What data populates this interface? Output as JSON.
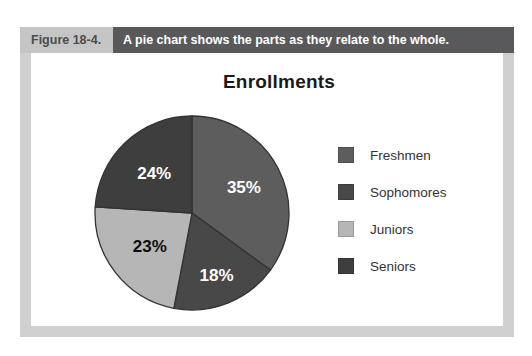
{
  "figure": {
    "label": "Figure 18-4.",
    "caption": "A pie chart shows the parts as they relate to the whole."
  },
  "chart_data": {
    "type": "pie",
    "title": "Enrollments",
    "categories": [
      "Freshmen",
      "Sophomores",
      "Juniors",
      "Seniors"
    ],
    "values": [
      35,
      18,
      23,
      24
    ],
    "slice_labels": [
      "35%",
      "18%",
      "23%",
      "24%"
    ],
    "colors": [
      "#5d5d5d",
      "#484848",
      "#b6b6b6",
      "#3e3e3e"
    ],
    "slice_label_colors": [
      "#ffffff",
      "#ffffff",
      "#0d0d0d",
      "#ffffff"
    ],
    "start": "top",
    "direction": "clockwise",
    "legend_position": "right"
  },
  "colors": {
    "frame_border": "#d0d0d0",
    "figure_label_bg": "#c5c5c5",
    "figure_label_text": "#4d4d4d",
    "caption_bar_bg": "#59595b",
    "caption_text": "#ffffff",
    "title_text": "#1a1a1a",
    "slice_stroke": "#333333",
    "legend_label_text": "#333333"
  }
}
